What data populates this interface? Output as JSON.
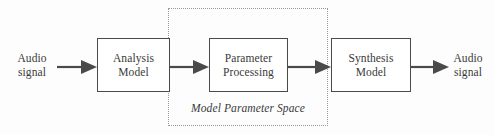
{
  "diagram": {
    "colors": {
      "background": "#fdfdfd",
      "box_stroke": "#4a4a4a",
      "text": "#3a3a3a",
      "dotted_stroke": "#9a9a9a",
      "arrow": "#4a4a4a"
    },
    "input": {
      "line1": "Audio",
      "line2": "signal"
    },
    "output": {
      "line1": "Audio",
      "line2": "signal"
    },
    "blocks": [
      {
        "id": "analysis",
        "line1": "Analysis",
        "line2": "Model"
      },
      {
        "id": "parameter",
        "line1": "Parameter",
        "line2": "Processing"
      },
      {
        "id": "synthesis",
        "line1": "Synthesis",
        "line2": "Model"
      }
    ],
    "region": {
      "caption": "Model Parameter Space"
    },
    "arrows": [
      {
        "id": "input-to-analysis",
        "direction": "right"
      },
      {
        "id": "analysis-to-parameter",
        "direction": "right"
      },
      {
        "id": "parameter-to-synthesis",
        "direction": "right"
      },
      {
        "id": "synthesis-to-output",
        "direction": "right"
      }
    ]
  }
}
